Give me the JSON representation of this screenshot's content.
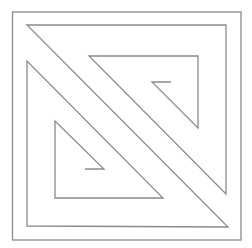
{
  "diagram": {
    "width": 252,
    "height": 248,
    "background": "#ffffff",
    "stroke_color": "#8a8a8a",
    "stroke_width": 1.3,
    "outer_frame": {
      "x": 12.5,
      "y": 12,
      "width": 228.5,
      "height": 228
    },
    "spiral_path": [
      [
        85,
        169
      ],
      [
        104,
        169
      ],
      [
        55,
        121
      ],
      [
        55,
        198
      ],
      [
        163,
        198
      ],
      [
        27,
        61
      ],
      [
        27,
        226
      ],
      [
        228,
        227
      ],
      [
        27,
        25
      ],
      [
        226,
        25
      ],
      [
        226,
        194
      ],
      [
        89,
        56
      ],
      [
        198,
        56
      ],
      [
        198,
        128
      ],
      [
        152,
        82
      ],
      [
        171,
        82
      ]
    ]
  }
}
